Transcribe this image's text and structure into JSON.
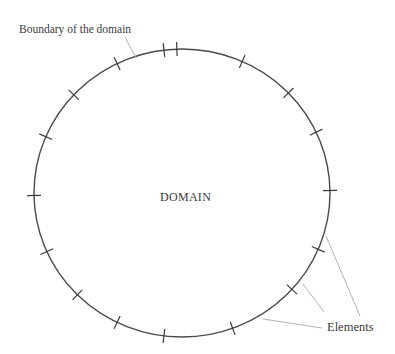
{
  "diagram": {
    "type": "domain-boundary-discretization",
    "labels": {
      "boundary": "Boundary of the domain",
      "domain": "DOMAIN",
      "elements": "Elements"
    },
    "boundary_shape": {
      "kind": "ellipse",
      "cx": 182,
      "cy": 193,
      "rx": 148,
      "ry": 144
    },
    "element_nodes_deg": [
      -92,
      -66,
      -44,
      -25,
      -1,
      23,
      42,
      70,
      97,
      116,
      135,
      156,
      179,
      203,
      223,
      244,
      263
    ],
    "tick_length": 14,
    "leaders": {
      "boundary": {
        "x1": 125,
        "y1": 37,
        "x2": 136,
        "y2": 58
      },
      "elements": [
        {
          "x1": 326,
          "y1": 236,
          "x2": 360,
          "y2": 316
        },
        {
          "x1": 303,
          "y1": 284,
          "x2": 324,
          "y2": 312
        },
        {
          "x1": 263,
          "y1": 319,
          "x2": 322,
          "y2": 328
        }
      ]
    },
    "colors": {
      "boundary": "#4a4a4a",
      "tick": "#3a3a3a",
      "leader": "#a8a8a8",
      "text": "#3a3a3a",
      "background": "#ffffff"
    }
  }
}
